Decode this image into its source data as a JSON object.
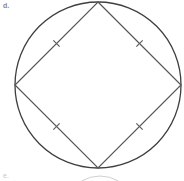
{
  "figure": {
    "item_label": "d.",
    "next_item_label": "e.",
    "type": "circle-with-inscribed-square",
    "colors": {
      "stroke": "#4a4a4a",
      "circle_stroke": "#3f3f3f",
      "square_stroke": "#555555",
      "tick_stroke": "#5a5a5a",
      "background": "#ffffff",
      "label": "#8a8a8a",
      "faint": "#c9c9c9"
    },
    "geometry": {
      "circle": {
        "center_x": 98,
        "center_y": 85,
        "radius": 83,
        "stroke_width": 1.3
      },
      "square": {
        "rotation_degrees": 45,
        "vertices": [
          {
            "name": "top",
            "x": 98,
            "y": 2
          },
          {
            "name": "right",
            "x": 181,
            "y": 85
          },
          {
            "name": "bottom",
            "x": 98,
            "y": 168
          },
          {
            "name": "left",
            "x": 15,
            "y": 85
          }
        ],
        "stroke_width": 1.2,
        "fill": "none"
      },
      "tick_marks": {
        "count_per_side": 1,
        "length": 9,
        "stroke_width": 1.1,
        "positions": [
          {
            "side": "top-left",
            "x": 56.5,
            "y": 43.5,
            "angle_degrees": 45
          },
          {
            "side": "top-right",
            "x": 139.5,
            "y": 43.5,
            "angle_degrees": -45
          },
          {
            "side": "bottom-left",
            "x": 56.5,
            "y": 126.5,
            "angle_degrees": -45
          },
          {
            "side": "bottom-right",
            "x": 139.5,
            "y": 126.5,
            "angle_degrees": 45
          }
        ]
      },
      "partial_next_figure_arc": {
        "visible": true,
        "center_x": 100,
        "center_y": 212,
        "radius": 36,
        "stroke": "#d0d0d0",
        "stroke_width": 1
      }
    }
  }
}
